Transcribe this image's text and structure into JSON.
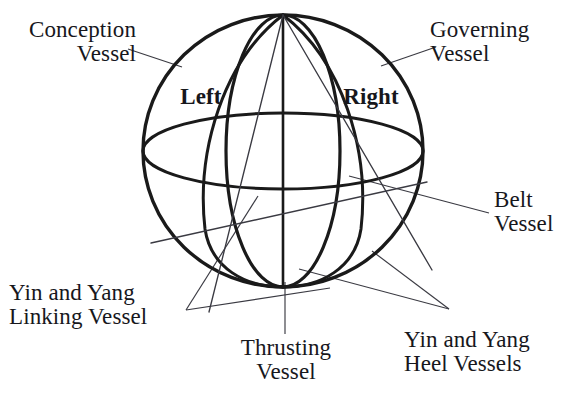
{
  "figure": {
    "type": "anatomical-schematic-sphere",
    "stroke_color": "#1a1a1a",
    "leader_color": "#3a3a42",
    "background_color": "#ffffff"
  },
  "labels": {
    "conception_vessel": "Conception\nVessel",
    "governing_vessel": "Governing\nVessel",
    "belt_vessel": "Belt\nVessel",
    "thrusting_vessel": "Thrusting\nVessel",
    "linking_vessel": "Yin and Yang\nLinking Vessel",
    "heel_vessels": "Yin and Yang\nHeel Vessels",
    "left": "Left",
    "right": "Right"
  },
  "geometry": {
    "sphere_center": [
      283,
      151
    ],
    "sphere_rx": 140,
    "sphere_ry": 136,
    "meridian_rx": 57,
    "equator_ry": 38
  }
}
